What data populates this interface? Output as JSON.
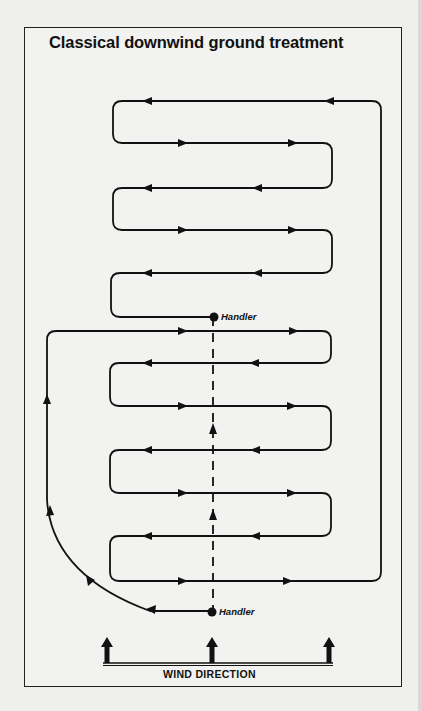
{
  "title": "Classical downwind ground treatment",
  "handlers": [
    {
      "label": "Handler",
      "position": "upper",
      "x": 214,
      "y": 317
    },
    {
      "label": "Handler",
      "position": "lower",
      "x": 212,
      "y": 612
    }
  ],
  "wind": {
    "label": "WIND DIRECTION",
    "arrow_count": 3,
    "direction": "up"
  },
  "colors": {
    "line": "#111111",
    "background": "#f2f2f0",
    "border": "#222222"
  },
  "legend": {
    "route_path": "zigzag sweep route (solid line with direction arrows)",
    "handler_walk": "handler walking line (dashed, upwind)"
  }
}
